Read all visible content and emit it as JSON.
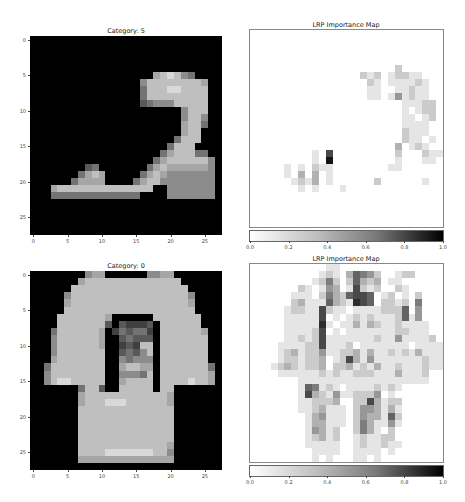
{
  "panels": [
    {
      "id": "top-left",
      "title": "Category: 5",
      "kind": "image",
      "box": {
        "left": 30,
        "top": 36,
        "width": 192,
        "height": 199
      }
    },
    {
      "id": "top-right",
      "title": "LRP Importance Map",
      "kind": "heatmap",
      "box": {
        "left": 250,
        "top": 30,
        "width": 193,
        "height": 197
      },
      "colorbar": {
        "left": 250,
        "top": 231,
        "width": 193,
        "height": 10
      }
    },
    {
      "id": "bottom-left",
      "title": "Category: 0",
      "kind": "image",
      "box": {
        "left": 30,
        "top": 271,
        "width": 192,
        "height": 199
      }
    },
    {
      "id": "bottom-right",
      "title": "LRP Importance Map",
      "kind": "heatmap",
      "box": {
        "left": 250,
        "top": 264,
        "width": 193,
        "height": 198
      },
      "colorbar": {
        "left": 250,
        "top": 466,
        "width": 193,
        "height": 10
      }
    }
  ],
  "axis_ticks": {
    "values": [
      0,
      5,
      10,
      15,
      20,
      25
    ],
    "labels": [
      "0",
      "5",
      "10",
      "15",
      "20",
      "25"
    ]
  },
  "colorbar_ticks": {
    "values": [
      0.0,
      0.2,
      0.4,
      0.6,
      0.8,
      1.0
    ],
    "labels": [
      "0.0",
      "0.2",
      "0.4",
      "0.6",
      "0.8",
      "1.0"
    ]
  },
  "caption": "",
  "chart_data": [
    {
      "type": "heatmap",
      "title": "Category: 5",
      "subject": "sandal (Fashion-MNIST)",
      "colormap": "gray (0=black, 9=white)",
      "xlim": [
        0,
        27
      ],
      "ylim": [
        27,
        0
      ],
      "xticks": [
        0,
        5,
        10,
        15,
        20,
        25
      ],
      "yticks": [
        0,
        5,
        10,
        15,
        20,
        25
      ],
      "grid_rows": [
        "0000000000000000000000000000",
        "0000000000000000000000000000",
        "0000000000000000000000000000",
        "0000000000000000000000000000",
        "0000000000000000000000000000",
        "0000000000000000006787540000",
        "0000000000000000577777777600",
        "0000000000000000477788777700",
        "0000000000000000477777777700",
        "0000000000000000345557777700",
        "0000000000000000000000577700",
        "0000000000000000000000577500",
        "0000000000000000000000677400",
        "0000000000000000000000677000",
        "0000000000000000000004777000",
        "0000000000000000000047770000",
        "0000000000000000000467774400",
        "0000000000000000004677777750",
        "0000000034000000046766666650",
        "0000000467600000467655555550",
        "0000004666600004677555555550",
        "0006777777777777770055555550",
        "0004444444444444000055555550",
        "0000000000000000000000000000",
        "0000000000000000000000000000",
        "0000000000000000000000000000",
        "0000000000000000000000000000",
        "0000000000000000000000000000"
      ]
    },
    {
      "type": "heatmap",
      "title": "LRP Importance Map",
      "subject": "relevance for Category: 5",
      "colormap": "gray_r (0=white, 9=black)",
      "colorbar_range": [
        0.0,
        1.0
      ],
      "grid_rows": [
        "0000000000000000000000000000",
        "0000000000000000000000000000",
        "0000000000000000000000000000",
        "0000000000000000000000000000",
        "0000000000000000000000000000",
        "0000000000000000000002000000",
        "0000000000000000212012211000",
        "0000000000000000021011112100",
        "0000000000000000011001121100",
        "0000000000000000011014121100",
        "0000000000000000000000111220",
        "0000000000000000000000101220",
        "0000000000000000000000110120",
        "0000000000000000000000111100",
        "0000000000000000000000211100",
        "0000000000000000000000211010",
        "0000000000000000000003012100",
        "0000000001070000000002000211",
        "0000000001090000000001000110",
        "0000010102110000000011000000",
        "0000010303010000000000000000",
        "0000001213010000002000000100",
        "0000000101000100000000000000",
        "0000000000000000000000000000",
        "0000000000000000000000000000",
        "0000000000000000000000000000",
        "0000000000000000000000000000",
        "0000000000000000000000000000"
      ]
    },
    {
      "type": "heatmap",
      "title": "Category: 0",
      "subject": "t-shirt/top (Fashion-MNIST)",
      "colormap": "gray (0=black, 9=white)",
      "xlim": [
        0,
        27
      ],
      "ylim": [
        27,
        0
      ],
      "xticks": [
        0,
        5,
        10,
        15,
        20,
        25
      ],
      "yticks": [
        0,
        5,
        10,
        15,
        20,
        25
      ],
      "grid_rows": [
        "0000000056600000055660000000",
        "0000000677777777777777000000",
        "0000007777777777777777700000",
        "0000057777777777777777750000",
        "0000067777777777777777760000",
        "0000077777777777777777770000",
        "0000777777760000007777777000",
        "0000777777730322230777777000",
        "0004777777602434420777777600",
        "0005777777600343330777777700",
        "0005777777600232770777777700",
        "0005777777700343570777777700",
        "0006777777700545550777777700",
        "0047777777700677660777777740",
        "0057777777700555470777777760",
        "0057887777700677770777787760",
        "0000000477300777770770000000",
        "0000000677777777777760000000",
        "0000000677788877777760000000",
        "0000000777777777777770000000",
        "0000000777777777777770000000",
        "0000000777777777777770000000",
        "0000000777777777777770000000",
        "0000000777777777777770000000",
        "0000000777777777777760000000",
        "0000000777788888887750000000",
        "0000000666666666666660000000",
        "0000000000000000000000000000"
      ]
    },
    {
      "type": "heatmap",
      "title": "LRP Importance Map",
      "subject": "relevance for Category: 0",
      "colormap": "gray_r (0=white, 9=black)",
      "colorbar_range": [
        0.0,
        1.0
      ],
      "grid_rows": [
        "0000000000011000000000000000",
        "0000000000121036542001220000",
        "0000000001252026323011000000",
        "0000000210143017212002100000",
        "0000001110253267760120102000",
        "0000002311163218760221205000",
        "0000012211721101111222604000",
        "0000011111701012121112614000",
        "0000011111810113132112111100",
        "0000011112701011111112211100",
        "0000011212711111112114111120",
        "0000111122711120111111101111",
        "0000123122411223131121213111",
        "0000122122301273141111111211",
        "0001232122302231213112111211",
        "0000111111212112221113111200",
        "0000000111111111111111111100",
        "0000000165121011112121000000",
        "0000000173214112224010000000",
        "0000000112223002273122000000",
        "0000000112311102443131000000",
        "0000000013411102433162000000",
        "0000000013311102531141000000",
        "0000000014312002531020000000",
        "0000000012312001211220000000",
        "0000000011111001211211000000",
        "0000000001111001111010000000",
        "0000000001010001101000000000"
      ]
    }
  ]
}
